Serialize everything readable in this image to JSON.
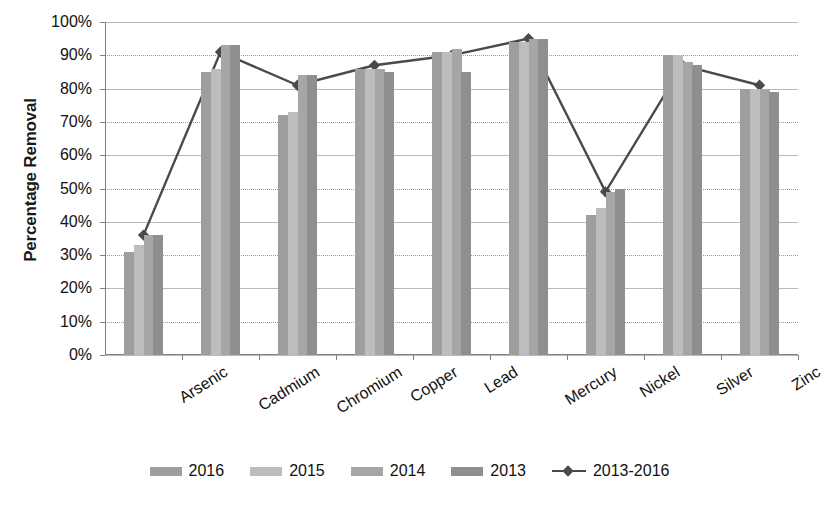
{
  "chart_data": {
    "type": "bar",
    "title": "",
    "xlabel": "",
    "ylabel": "Percentage Removal",
    "ylim": [
      0,
      100
    ],
    "ytick_labels": [
      "100%",
      "90%",
      "80%",
      "70%",
      "60%",
      "50%",
      "40%",
      "30%",
      "20%",
      "10%",
      "0%"
    ],
    "ytick_values": [
      100,
      90,
      80,
      70,
      60,
      50,
      40,
      30,
      20,
      10,
      0
    ],
    "grid": true,
    "legend_position": "bottom",
    "categories": [
      "Arsenic",
      "Cadmium",
      "Chromium",
      "Copper",
      "Lead",
      "Mercury",
      "Nickel",
      "Silver",
      "Zinc"
    ],
    "series": [
      {
        "name": "2016",
        "type": "bar",
        "color": "#9e9e9e",
        "values": [
          31,
          85,
          72,
          86,
          91,
          94,
          42,
          90,
          80
        ]
      },
      {
        "name": "2015",
        "type": "bar",
        "color": "#bdbdbd",
        "values": [
          33,
          86,
          73,
          86,
          91,
          94,
          44,
          90,
          80
        ]
      },
      {
        "name": "2014",
        "type": "bar",
        "color": "#a6a6a6",
        "values": [
          36,
          93,
          84,
          86,
          92,
          95,
          49,
          88,
          80
        ]
      },
      {
        "name": "2013",
        "type": "bar",
        "color": "#8f8f8f",
        "values": [
          36,
          93,
          84,
          85,
          85,
          95,
          50,
          87,
          79
        ]
      },
      {
        "name": "2013-2016",
        "type": "line",
        "color": "#4a4a4a",
        "values": [
          36,
          91,
          81,
          87,
          90,
          95,
          49,
          87,
          81
        ]
      }
    ]
  },
  "legend": {
    "items": [
      {
        "label": "2016",
        "kind": "swatch",
        "color": "#9e9e9e"
      },
      {
        "label": "2015",
        "kind": "swatch",
        "color": "#bdbdbd"
      },
      {
        "label": "2014",
        "kind": "swatch",
        "color": "#a6a6a6"
      },
      {
        "label": "2013",
        "kind": "swatch",
        "color": "#8f8f8f"
      },
      {
        "label": "2013-2016",
        "kind": "line",
        "color": "#4a4a4a"
      }
    ]
  }
}
